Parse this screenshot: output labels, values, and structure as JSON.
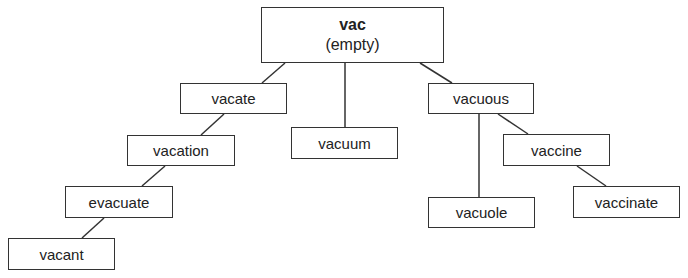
{
  "root": {
    "title": "vac",
    "subtitle": "(empty)"
  },
  "nodes": {
    "vacate": "vacate",
    "vacation": "vacation",
    "evacuate": "evacuate",
    "vacant": "vacant",
    "vacuum": "vacuum",
    "vacuous": "vacuous",
    "vaccine": "vaccine",
    "vacuole": "vacuole",
    "vaccinate": "vaccinate"
  },
  "edges": [
    [
      "vac",
      "vacate"
    ],
    [
      "vacate",
      "vacation"
    ],
    [
      "vacation",
      "evacuate"
    ],
    [
      "evacuate",
      "vacant"
    ],
    [
      "vac",
      "vacuum"
    ],
    [
      "vac",
      "vacuous"
    ],
    [
      "vacuous",
      "vacuole"
    ],
    [
      "vacuous",
      "vaccine"
    ],
    [
      "vaccine",
      "vaccinate"
    ]
  ]
}
